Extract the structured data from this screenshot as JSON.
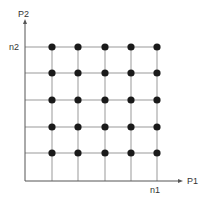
{
  "diagram": {
    "axes": {
      "x_label": "P1",
      "y_label": "P2",
      "x_tick_label": "n1",
      "y_tick_label": "n2"
    },
    "grid": {
      "columns": 5,
      "rows": 5,
      "col_x": [
        52,
        78,
        105,
        131,
        157
      ],
      "row_y": [
        47,
        73,
        100,
        127,
        153
      ]
    },
    "colors": {
      "axis": "#555555",
      "grid_line": "#999999",
      "dot": "#1a1a1a"
    }
  }
}
